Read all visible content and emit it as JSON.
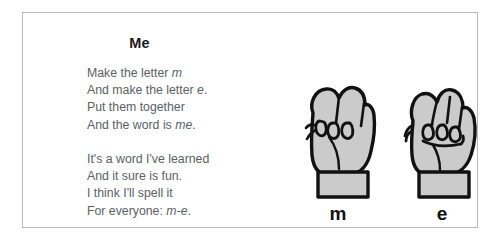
{
  "page": {
    "background": "#ffffff",
    "card_border_color": "#b9b9b9"
  },
  "poem": {
    "title": "Me",
    "text_color": "#5b6166",
    "stanzas": [
      {
        "lines": [
          {
            "text": "Make the letter ",
            "italic": "m",
            "after": ""
          },
          {
            "text": "And make the letter ",
            "italic": "e",
            "after": "."
          },
          {
            "text": "Put them together",
            "italic": "",
            "after": ""
          },
          {
            "text": "And the word is ",
            "italic": "me",
            "after": "."
          }
        ]
      },
      {
        "lines": [
          {
            "text": "It's a word I've learned",
            "italic": "",
            "after": ""
          },
          {
            "text": "And it sure is fun.",
            "italic": "",
            "after": ""
          },
          {
            "text": "I think I'll spell it",
            "italic": "",
            "after": ""
          },
          {
            "text": "For everyone: ",
            "italic": "m-e",
            "after": "."
          }
        ]
      }
    ]
  },
  "illustrations": {
    "fill_color": "#cbcbcb",
    "outline_color": "#111111",
    "hands": [
      {
        "name": "asl-hand-m",
        "label": "m",
        "description": "ASL fingerspelling hand sign for the letter M"
      },
      {
        "name": "asl-hand-e",
        "label": "e",
        "description": "ASL fingerspelling hand sign for the letter E"
      }
    ]
  }
}
